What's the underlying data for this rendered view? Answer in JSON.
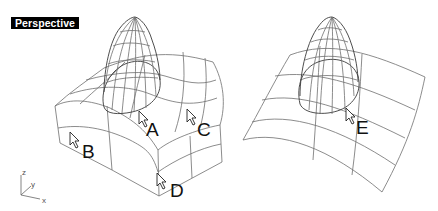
{
  "viewport": {
    "title": "Perspective",
    "background": "#ffffff"
  },
  "axes": {
    "z": "z",
    "y": "y",
    "x": "x"
  },
  "callouts": [
    {
      "id": "A",
      "label": "A"
    },
    {
      "id": "B",
      "label": "B"
    },
    {
      "id": "C",
      "label": "C"
    },
    {
      "id": "D",
      "label": "D"
    },
    {
      "id": "E",
      "label": "E"
    }
  ],
  "objects": [
    {
      "name": "polysurface-with-dome",
      "type": "wireframe"
    },
    {
      "name": "curved-surface-with-dome",
      "type": "wireframe"
    }
  ],
  "colors": {
    "wire": "#6e6e6e",
    "label_bg": "#000000",
    "label_fg": "#ffffff"
  }
}
